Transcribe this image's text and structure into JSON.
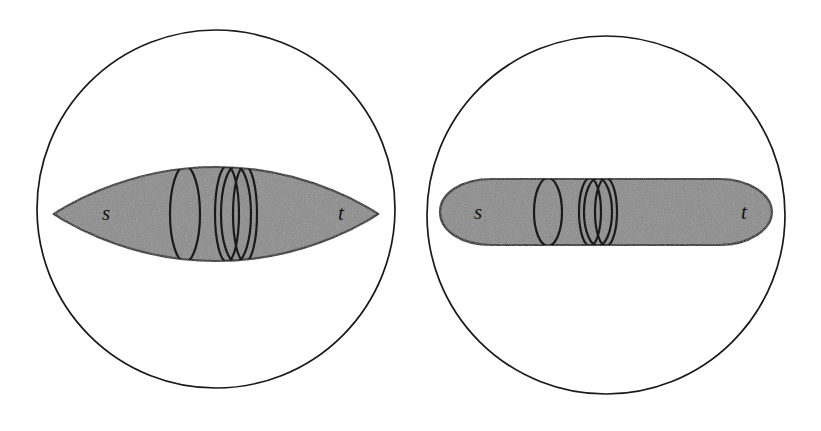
{
  "figure": {
    "background_color": "#ffffff",
    "stroke_color": "#1a1a1a",
    "fill_gray": "#8a8a8a",
    "panels": [
      {
        "id": "left-panel",
        "name": "lens-shaped-surface-panel",
        "outer_boundary": {
          "shape": "circle",
          "cx": 216,
          "cy": 209,
          "r": 179
        },
        "region": {
          "shape": "lens-ellipse",
          "cx": 216,
          "cy": 214,
          "rx": 162,
          "ry": 47,
          "fill": "#8a8a8a"
        },
        "labels": [
          {
            "text": "s",
            "x": 106,
            "y": 220
          },
          {
            "text": "t",
            "x": 341,
            "y": 220
          }
        ],
        "curves": [
          {
            "name": "single-curve",
            "cx": 185,
            "cy": 214,
            "rx": 15,
            "ry": 47,
            "count": 1
          },
          {
            "name": "curve-cluster",
            "cx": 236,
            "cy": 214,
            "count": 3
          }
        ]
      },
      {
        "id": "right-panel",
        "name": "capsule-shaped-surface-panel",
        "outer_boundary": {
          "shape": "circle",
          "cx": 606,
          "cy": 215,
          "r": 179
        },
        "region": {
          "shape": "capsule",
          "x1": 440,
          "x2": 772,
          "cy": 212,
          "half_height": 33,
          "cap_length": 52,
          "fill": "#8a8a8a"
        },
        "labels": [
          {
            "text": "s",
            "x": 478,
            "y": 219
          },
          {
            "text": "t",
            "x": 744,
            "y": 219
          }
        ],
        "curves": [
          {
            "name": "single-curve",
            "cx": 548,
            "cy": 212,
            "rx": 14,
            "ry": 33,
            "count": 1
          },
          {
            "name": "curve-cluster",
            "cx": 598,
            "cy": 212,
            "count": 3
          }
        ]
      }
    ]
  }
}
